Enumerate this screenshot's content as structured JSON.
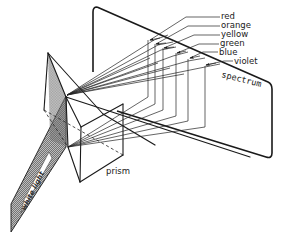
{
  "figure": {
    "labels": {
      "beam": "white light",
      "prism": "prism",
      "screen": "spectrum"
    },
    "colors_list": [
      "red",
      "orange",
      "yellow",
      "green",
      "blue",
      "violet"
    ],
    "style": {
      "ink": "#1a1a1a",
      "background": "#ffffff",
      "beam_hatch": "#7a7a7a"
    }
  }
}
